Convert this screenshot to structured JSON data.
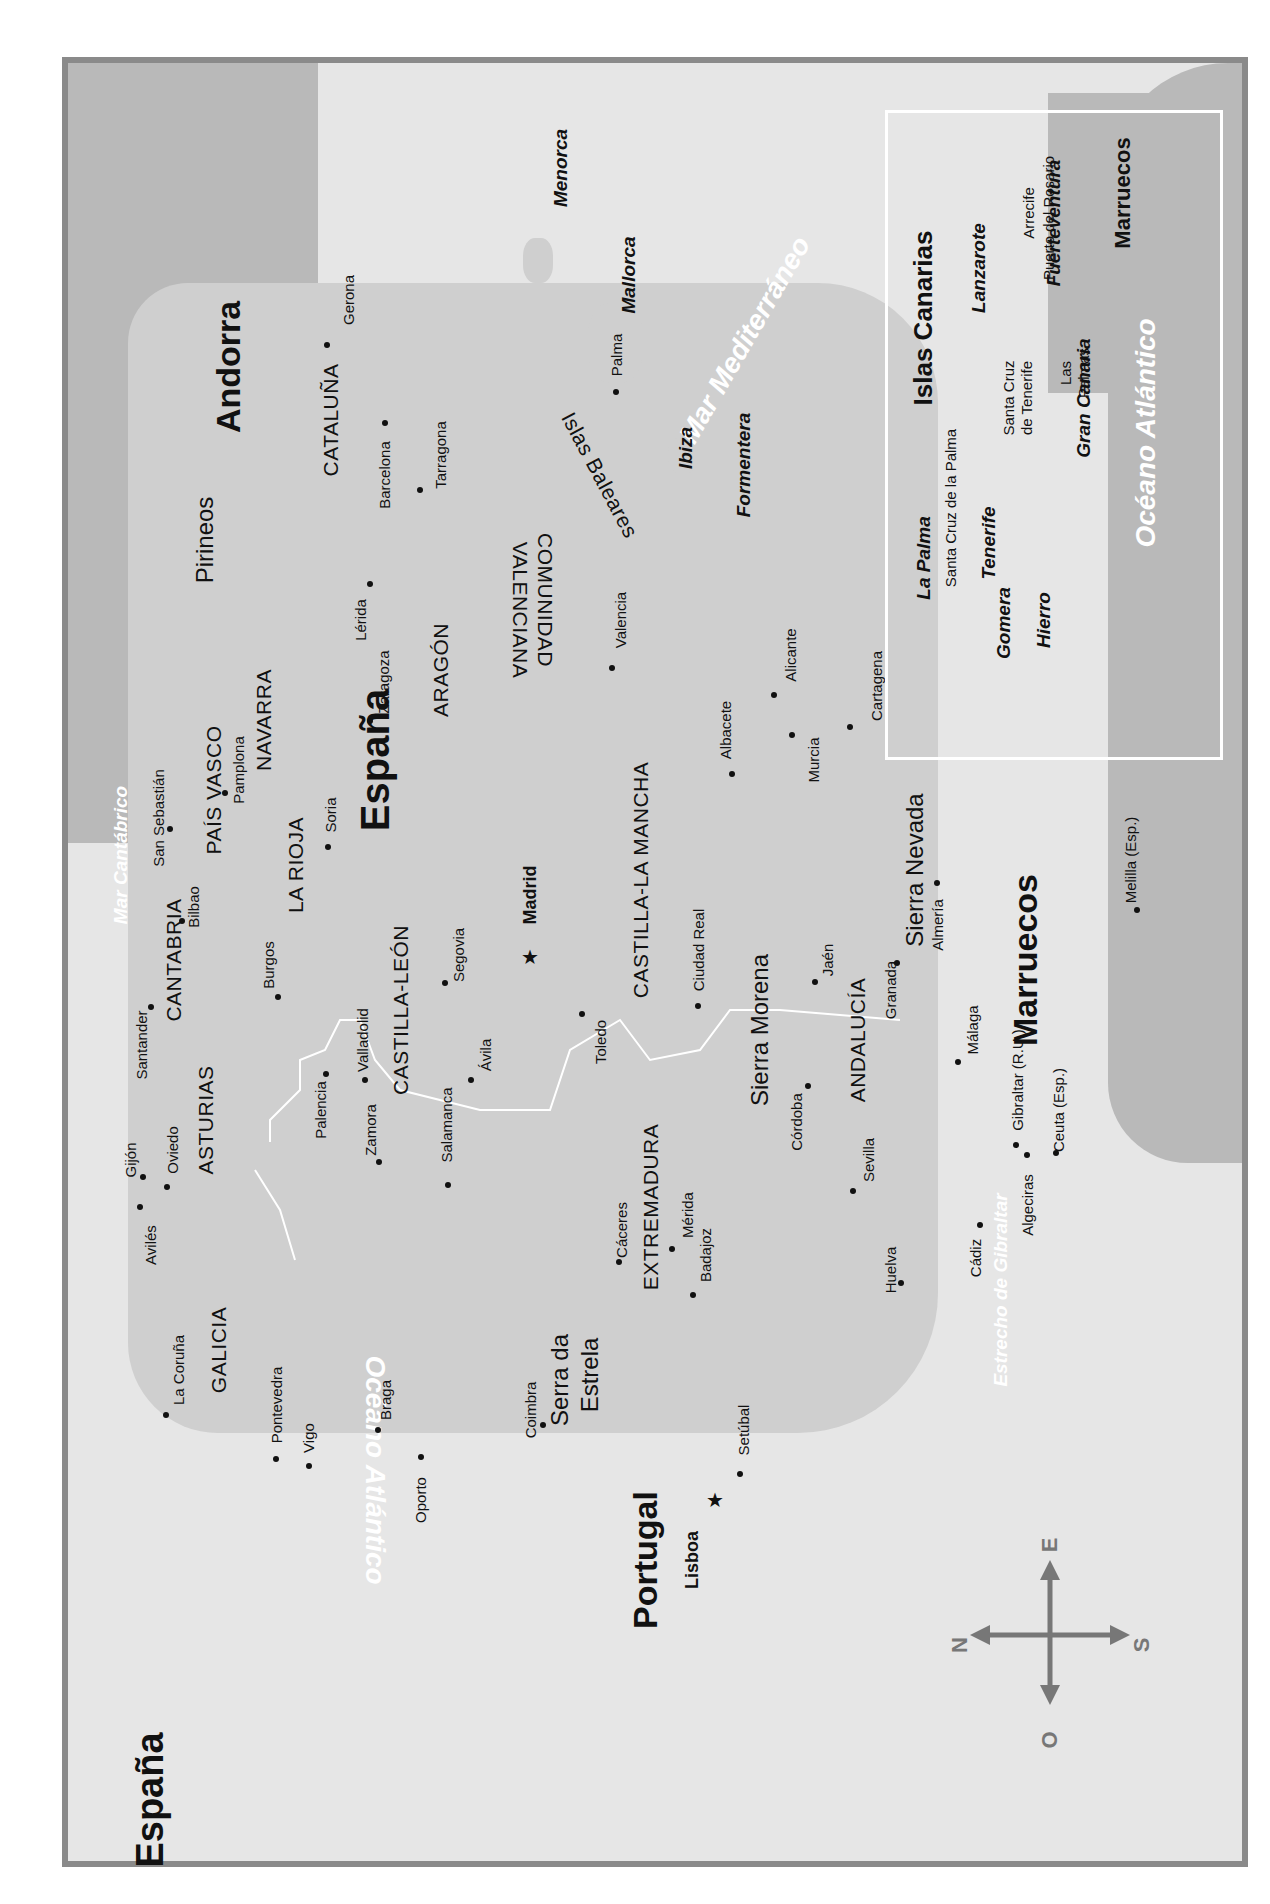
{
  "map": {
    "title": "España",
    "orientation": "rotated 90° counter-clockwise",
    "colors": {
      "frame": "#8a8a8a",
      "sea": "#e6e6e6",
      "land": "#cfcfcf",
      "neighbor": "#b9b9b9",
      "border": "#ffffff"
    },
    "countries": {
      "spain": "España",
      "spain_title": "España",
      "portugal": "Portugal",
      "andorra": "Andorra",
      "morocco": "Marruecos",
      "morocco_inset": "Marruecos"
    },
    "waters": {
      "atlantic": "Océano Atlántico",
      "atlantic_inset": "Océano Atlántico",
      "mediterranean": "Mar Mediterráneo",
      "cantabrico": "Mar Cantábrico",
      "gibraltar": "Estrecho de Gibraltar"
    },
    "regions": [
      "CATALUÑA",
      "ARAGÓN",
      "COMUNIDAD",
      "VALENCIANA",
      "NAVARRA",
      "PAÍS VASCO",
      "LA RIOJA",
      "CANTABRIA",
      "ASTURIAS",
      "GALICIA",
      "CASTILLA-LEÓN",
      "CASTILLA-LA MANCHA",
      "EXTREMADURA",
      "ANDALUCÍA"
    ],
    "ranges": [
      "Pirineos",
      "Sierra Morena",
      "Sierra Nevada",
      "Serra da",
      "Estrela"
    ],
    "capitals": [
      "Madrid",
      "Lisboa"
    ],
    "cities": [
      "Gerona",
      "Barcelona",
      "Tarragona",
      "Lérida",
      "Zaragoza",
      "Valencia",
      "Alicante",
      "Albacete",
      "Murcia",
      "Cartagena",
      "Pamplona",
      "San Sebastián",
      "Bilbao",
      "Soria",
      "Burgos",
      "Santander",
      "Gijón",
      "Oviedo",
      "Avilés",
      "La Coruña",
      "Pontevedra",
      "Vigo",
      "Palencia",
      "Valladolid",
      "Zamora",
      "Salamanca",
      "Ávila",
      "Segovia",
      "Toledo",
      "Ciudad Real",
      "Jaén",
      "Granada",
      "Almería",
      "Málaga",
      "Córdoba",
      "Sevilla",
      "Cáceres",
      "Mérida",
      "Badajoz",
      "Huelva",
      "Cádiz",
      "Algeciras",
      "Gibraltar (R.U.)",
      "Ceuta (Esp.)",
      "Melilla (Esp.)",
      "Braga",
      "Oporto",
      "Coimbra",
      "Setúbal"
    ],
    "balearics": {
      "group": "Islas Baleares",
      "islands": [
        "Menorca",
        "Mallorca",
        "Ibiza",
        "Formentera"
      ],
      "city": "Palma"
    },
    "canarias": {
      "title": "Islas Canarias",
      "islands": [
        "La Palma",
        "Tenerife",
        "Gomera",
        "Hierro",
        "Gran Canaria",
        "Lanzarote",
        "Fuerteventura"
      ],
      "cities": [
        "Santa Cruz de la Palma",
        "Santa Cruz",
        "de Tenerife",
        "Las",
        "Palmas",
        "Arrecife",
        "Puerto del Rosario"
      ]
    },
    "compass": {
      "n": "N",
      "s": "S",
      "e": "E",
      "o": "O"
    }
  }
}
